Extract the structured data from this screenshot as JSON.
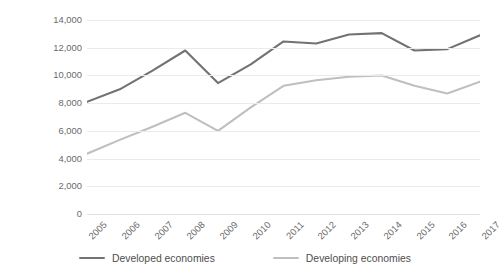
{
  "chart_data": {
    "type": "line",
    "title": "",
    "xlabel": "",
    "ylabel": "Billions of US dollars",
    "ylim": [
      0,
      14000
    ],
    "ytick_values": [
      0,
      2000,
      4000,
      6000,
      8000,
      10000,
      12000,
      14000
    ],
    "ytick_labels": [
      "0",
      "2,000",
      "4,000",
      "6,000",
      "8,000",
      "10,000",
      "12,000",
      "14,000"
    ],
    "grid": true,
    "legend_position": "bottom",
    "categories": [
      "2005",
      "2006",
      "2007",
      "2008",
      "2009",
      "2010",
      "2011",
      "2012",
      "2013",
      "2014",
      "2015",
      "2016",
      "2017"
    ],
    "x": [
      2005,
      2006,
      2007,
      2008,
      2009,
      2010,
      2011,
      2012,
      2013,
      2014,
      2015,
      2016,
      2017
    ],
    "series": [
      {
        "name": "Developed economies",
        "color": "#767171",
        "values": [
          8100,
          9000,
          10350,
          11800,
          9450,
          10800,
          12450,
          12300,
          12950,
          13050,
          11800,
          11900,
          12900
        ]
      },
      {
        "name": "Developing economies",
        "color": "#bfbfbf",
        "values": [
          4350,
          5350,
          6300,
          7300,
          6000,
          7700,
          9250,
          9650,
          9900,
          10000,
          9250,
          8700,
          9550
        ]
      }
    ]
  },
  "colors": {
    "developed": "#767171",
    "developing": "#bfbfbf",
    "gridline": "#eceaea",
    "tick_text": "#6a6a6a",
    "legend_text": "#4e4e4e",
    "background": "#ffffff"
  },
  "legend": {
    "items": [
      {
        "label": "Developed economies",
        "swatch": "developed-line-swatch"
      },
      {
        "label": "Developing economies",
        "swatch": "developing-line-swatch"
      }
    ]
  },
  "axes": {
    "y_title": "Billions of US dollars"
  }
}
